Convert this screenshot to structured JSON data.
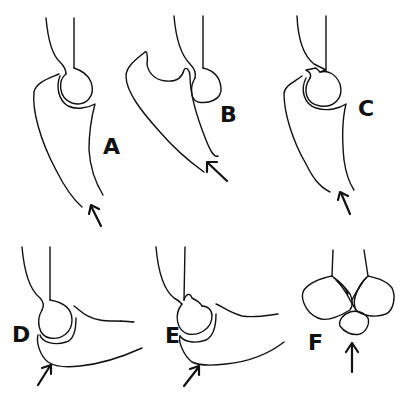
{
  "figure": {
    "panels": [
      {
        "id": "A",
        "label": "A",
        "arrow": "arrow-up-left"
      },
      {
        "id": "B",
        "label": "B",
        "arrow": "arrow-up-left"
      },
      {
        "id": "C",
        "label": "C",
        "arrow": "arrow-up-left"
      },
      {
        "id": "D",
        "label": "D",
        "arrow": "arrow-up-right"
      },
      {
        "id": "E",
        "label": "E",
        "arrow": "arrow-up-right"
      },
      {
        "id": "F",
        "label": "F",
        "arrow": "arrow-up"
      }
    ],
    "colors": {
      "line": "#111111",
      "background": "#ffffff"
    }
  }
}
